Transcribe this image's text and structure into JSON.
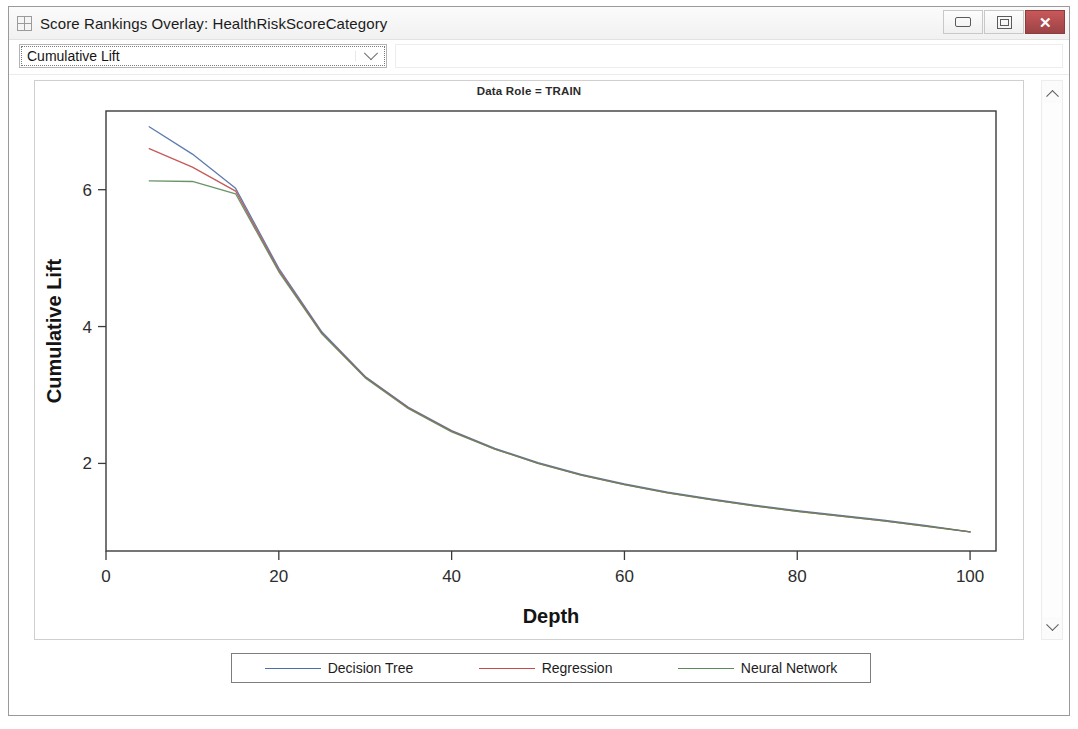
{
  "window": {
    "title": "Score Rankings Overlay: HealthRiskScoreCategory",
    "icon": "table-grid-icon",
    "buttons": {
      "minimize": "minimize-icon",
      "restore": "restore-icon",
      "close": "✕"
    }
  },
  "toolbar": {
    "combo": {
      "value": "Cumulative Lift",
      "placeholder": "Cumulative Lift",
      "arrow": "chevron-down-icon"
    }
  },
  "scrollbar": {
    "up": "chevron-up-icon",
    "down": "chevron-down-icon"
  },
  "legend": {
    "items": [
      {
        "label": "Decision Tree",
        "color": "#4f6fa8"
      },
      {
        "label": "Regression",
        "color": "#c24b4b"
      },
      {
        "label": "Neural Network",
        "color": "#5d8a5d"
      }
    ]
  },
  "chart_data": {
    "type": "line",
    "title": "Data Role = TRAIN",
    "xlabel": "Depth",
    "ylabel": "Cumulative Lift",
    "xlim": [
      0,
      103
    ],
    "ylim": [
      0.72,
      7.15
    ],
    "xticks": [
      0,
      20,
      40,
      60,
      80,
      100
    ],
    "yticks": [
      2,
      4,
      6
    ],
    "grid": false,
    "legend_position": "bottom",
    "x": [
      5,
      10,
      15,
      20,
      25,
      30,
      35,
      40,
      45,
      50,
      55,
      60,
      65,
      70,
      75,
      80,
      85,
      90,
      95,
      100
    ],
    "series": [
      {
        "name": "Decision Tree",
        "color": "#4f6fa8",
        "values": [
          6.92,
          6.52,
          6.02,
          4.85,
          3.92,
          3.27,
          2.82,
          2.48,
          2.22,
          2.01,
          1.84,
          1.7,
          1.58,
          1.48,
          1.39,
          1.31,
          1.24,
          1.17,
          1.09,
          1.0
        ]
      },
      {
        "name": "Regression",
        "color": "#c24b4b",
        "values": [
          6.6,
          6.33,
          5.98,
          4.82,
          3.9,
          3.26,
          2.81,
          2.47,
          2.21,
          2.0,
          1.83,
          1.69,
          1.57,
          1.47,
          1.38,
          1.3,
          1.23,
          1.16,
          1.08,
          1.0
        ]
      },
      {
        "name": "Neural Network",
        "color": "#5d8a5d",
        "values": [
          6.13,
          6.12,
          5.94,
          4.8,
          3.89,
          3.25,
          2.8,
          2.46,
          2.21,
          2.0,
          1.83,
          1.69,
          1.57,
          1.47,
          1.38,
          1.3,
          1.23,
          1.16,
          1.08,
          1.0
        ]
      }
    ]
  }
}
